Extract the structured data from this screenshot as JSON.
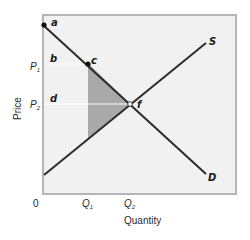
{
  "diagram": {
    "type": "supply-demand",
    "axes": {
      "x_title": "Quantity",
      "y_title": "Price",
      "origin_label": "0",
      "x_ticks": [
        {
          "base": "Q",
          "sub": "1"
        },
        {
          "base": "Q",
          "sub": "2"
        }
      ],
      "y_ticks": [
        {
          "base": "P",
          "sub": "1"
        },
        {
          "base": "P",
          "sub": "2"
        }
      ]
    },
    "curves": {
      "supply_label": "S",
      "demand_label": "D"
    },
    "points": {
      "a": "a",
      "b": "b",
      "c": "c",
      "d": "d",
      "f": "f"
    },
    "colors": {
      "plot_bg": "#f1f1f1",
      "frame": "#b5b5b5",
      "curve": "#2b2b2b",
      "shaded": "#a9a9a9",
      "guide": "#ffffff"
    }
  }
}
